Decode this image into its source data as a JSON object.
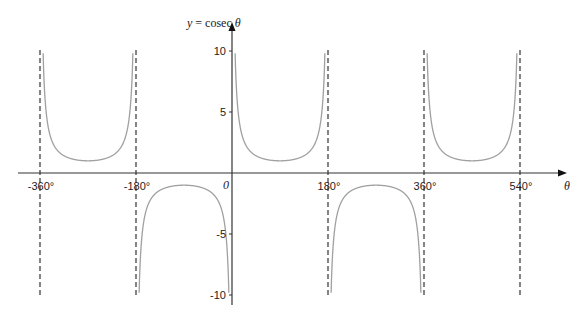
{
  "chart_data": {
    "type": "line",
    "title": "",
    "function": "cosec",
    "xlabel": "θ",
    "ylabel": "y = cosec θ",
    "ylabel_prefix": "y = cosec ",
    "ylabel_var": "θ",
    "origin_label": "0",
    "xlim": [
      -400,
      575
    ],
    "ylim": [
      -10,
      10
    ],
    "x_ticks": [
      {
        "value": -360,
        "label": "-360°"
      },
      {
        "value": -180,
        "label": "-180°"
      },
      {
        "value": 180,
        "label": "180°"
      },
      {
        "value": 360,
        "label": "360°"
      },
      {
        "value": 540,
        "label": "540°"
      }
    ],
    "y_ticks": [
      {
        "value": 10,
        "label": "10"
      },
      {
        "value": 5,
        "label": "5"
      },
      {
        "value": -5,
        "label": "-5"
      },
      {
        "value": -10,
        "label": "-10"
      }
    ],
    "asymptotes": [
      -360,
      -180,
      180,
      360,
      540
    ],
    "branches": [
      {
        "from": -360,
        "to": -180
      },
      {
        "from": -180,
        "to": 0
      },
      {
        "from": 0,
        "to": 180
      },
      {
        "from": 180,
        "to": 360
      },
      {
        "from": 360,
        "to": 540
      }
    ],
    "grid": false,
    "colors": {
      "curve": "#a0a0a0",
      "axis": "#333333",
      "asymptote": "#222222"
    }
  }
}
